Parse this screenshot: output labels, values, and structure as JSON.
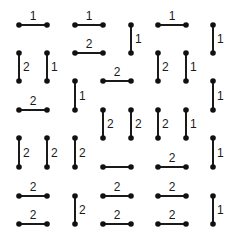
{
  "puzzle": {
    "grid": {
      "cols_x": [
        19,
        47,
        75,
        103,
        131,
        158,
        186,
        213
      ],
      "rows_y": [
        25,
        53,
        81,
        110,
        138,
        167,
        196,
        224
      ]
    },
    "colors": {
      "line": "#1a1a1a",
      "dot": "#111111",
      "background": "#ffffff"
    },
    "segments": [
      {
        "dir": "h",
        "c": 0,
        "r": 0,
        "label": "1"
      },
      {
        "dir": "h",
        "c": 2,
        "r": 0,
        "label": "1"
      },
      {
        "dir": "v",
        "c": 4,
        "r": 0,
        "label": "1"
      },
      {
        "dir": "h",
        "c": 5,
        "r": 0,
        "label": "1"
      },
      {
        "dir": "v",
        "c": 7,
        "r": 0,
        "label": "1"
      },
      {
        "dir": "v",
        "c": 0,
        "r": 1,
        "label": "2"
      },
      {
        "dir": "v",
        "c": 1,
        "r": 1,
        "label": "1"
      },
      {
        "dir": "h",
        "c": 2,
        "r": 1,
        "label": "2"
      },
      {
        "dir": "v",
        "c": 5,
        "r": 1,
        "label": "2"
      },
      {
        "dir": "v",
        "c": 6,
        "r": 1,
        "label": "1"
      },
      {
        "dir": "v",
        "c": 2,
        "r": 2,
        "label": "1"
      },
      {
        "dir": "h",
        "c": 3,
        "r": 2,
        "label": "2"
      },
      {
        "dir": "v",
        "c": 7,
        "r": 2,
        "label": "1"
      },
      {
        "dir": "h",
        "c": 0,
        "r": 3,
        "label": "2"
      },
      {
        "dir": "v",
        "c": 3,
        "r": 3,
        "label": "2"
      },
      {
        "dir": "v",
        "c": 4,
        "r": 3,
        "label": "2"
      },
      {
        "dir": "v",
        "c": 5,
        "r": 3,
        "label": "2"
      },
      {
        "dir": "v",
        "c": 6,
        "r": 3,
        "label": "1"
      },
      {
        "dir": "v",
        "c": 0,
        "r": 4,
        "label": "2"
      },
      {
        "dir": "v",
        "c": 1,
        "r": 4,
        "label": "2"
      },
      {
        "dir": "v",
        "c": 2,
        "r": 4,
        "label": "2"
      },
      {
        "dir": "v",
        "c": 7,
        "r": 4,
        "label": "1"
      },
      {
        "dir": "h",
        "c": 3,
        "r": 5,
        "label": ""
      },
      {
        "dir": "h",
        "c": 5,
        "r": 5,
        "label": "2"
      },
      {
        "dir": "h",
        "c": 0,
        "r": 6,
        "label": "2"
      },
      {
        "dir": "v",
        "c": 2,
        "r": 6,
        "label": "2"
      },
      {
        "dir": "h",
        "c": 3,
        "r": 6,
        "label": "2"
      },
      {
        "dir": "h",
        "c": 5,
        "r": 6,
        "label": "2"
      },
      {
        "dir": "v",
        "c": 7,
        "r": 6,
        "label": "1"
      },
      {
        "dir": "h",
        "c": 0,
        "r": 7,
        "label": "2"
      },
      {
        "dir": "h",
        "c": 3,
        "r": 7,
        "label": "2"
      },
      {
        "dir": "h",
        "c": 5,
        "r": 7,
        "label": "2"
      }
    ]
  }
}
